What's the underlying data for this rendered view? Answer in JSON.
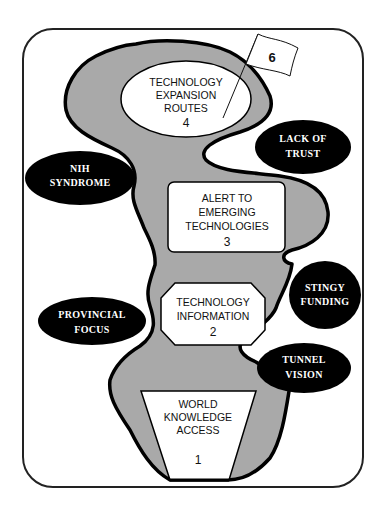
{
  "diagram": {
    "colors": {
      "frame": "#222222",
      "river_fill": "#a9a9a9",
      "river_outline": "#000000",
      "obstacle_fill": "#000000",
      "obstacle_text": "#ffffff",
      "stage_fill": "#ffffff"
    },
    "flag": {
      "label": "6"
    },
    "stages": [
      {
        "id": "world-knowledge-access",
        "shape": "trapezoid",
        "lines": [
          "WORLD",
          "KNOWLEDGE",
          "ACCESS"
        ],
        "number": "1"
      },
      {
        "id": "technology-information",
        "shape": "octagon",
        "lines": [
          "TECHNOLOGY",
          "INFORMATION"
        ],
        "number": "2"
      },
      {
        "id": "alert-to-emerging-technologies",
        "shape": "rounded-rectangle",
        "lines": [
          "ALERT TO",
          "EMERGING",
          "TECHNOLOGIES"
        ],
        "number": "3"
      },
      {
        "id": "technology-expansion-routes",
        "shape": "ellipse",
        "lines": [
          "TECHNOLOGY",
          "EXPANSION",
          "ROUTES"
        ],
        "number": "4"
      }
    ],
    "obstacles": [
      {
        "id": "nih-syndrome",
        "lines": [
          "NIH",
          "SYNDROME"
        ]
      },
      {
        "id": "lack-of-trust",
        "lines": [
          "LACK OF",
          "TRUST"
        ]
      },
      {
        "id": "provincial-focus",
        "lines": [
          "PROVINCIAL",
          "FOCUS"
        ]
      },
      {
        "id": "stingy-funding",
        "lines": [
          "STINGY",
          "FUNDING"
        ]
      },
      {
        "id": "tunnel-vision",
        "lines": [
          "TUNNEL",
          "VISION"
        ]
      }
    ]
  }
}
